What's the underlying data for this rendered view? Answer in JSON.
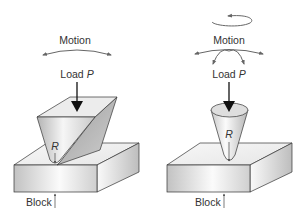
{
  "figure": {
    "panels": [
      {
        "id": "wedge",
        "motion_label": "Motion",
        "load_label": "Load",
        "load_symbol": "P",
        "radius_label": "R",
        "block_label": "Block",
        "indenter_shape": "wedge",
        "motion_icons": [
          "double-headed-arc-arrow"
        ]
      },
      {
        "id": "cone",
        "motion_label": "Motion",
        "load_label": "Load",
        "load_symbol": "P",
        "radius_label": "R",
        "block_label": "Block",
        "indenter_shape": "cone",
        "motion_icons": [
          "rotation-arrow",
          "double-headed-arc-arrow",
          "double-headed-small-arc-arrow"
        ]
      }
    ]
  },
  "colors": {
    "stroke": "#333333",
    "text": "#333333",
    "arrow_gray": "#666666",
    "block_front_light": "#f4f4f4",
    "block_front_dark": "#bdbdbd",
    "block_top": "#f2f2f2",
    "block_side": "#d0d0d0",
    "indenter_light": "#eeeeee",
    "indenter_dark": "#a8a8a8"
  }
}
